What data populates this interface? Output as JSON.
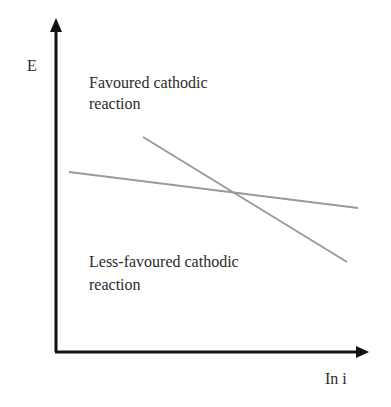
{
  "diagram": {
    "y_axis_label": "E",
    "x_axis_label": "In i",
    "region_labels": {
      "favoured_line1": "Favoured cathodic",
      "favoured_line2": "reaction",
      "less_favoured_line1": "Less-favoured cathodic",
      "less_favoured_line2": "reaction"
    },
    "colors": {
      "axis": "#111111",
      "lines": "#9a9a9a",
      "text": "#2b2b2b"
    },
    "lines": [
      {
        "name": "shallow-line",
        "x1": 69,
        "y1": 172,
        "x2": 358,
        "y2": 208
      },
      {
        "name": "steep-line",
        "x1": 143,
        "y1": 137,
        "x2": 347,
        "y2": 262
      }
    ]
  }
}
